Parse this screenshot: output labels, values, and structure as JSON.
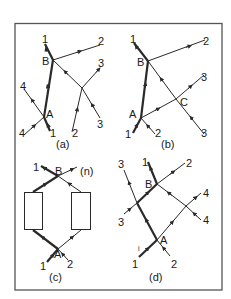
{
  "figure": {
    "frame": {
      "x": 15,
      "y": 23,
      "width": 207,
      "height": 267,
      "stroke": "#555555"
    },
    "colors": {
      "line": "#2a2a2a",
      "background": "#ffffff"
    },
    "panels": [
      {
        "id": "a",
        "caption": "(a)",
        "nodes": [
          {
            "name": "A",
            "label": "A"
          },
          {
            "name": "B",
            "label": "B"
          }
        ],
        "endpoint_labels": [
          "1",
          "2",
          "3",
          "4",
          "4",
          "1",
          "2",
          "3"
        ]
      },
      {
        "id": "b",
        "caption": "(b)",
        "nodes": [
          {
            "name": "A",
            "label": "A"
          },
          {
            "name": "B",
            "label": "B"
          },
          {
            "name": "C",
            "label": "C"
          }
        ],
        "endpoint_labels": [
          "1",
          "2",
          "3",
          "1",
          "2",
          "3"
        ]
      },
      {
        "id": "c",
        "caption": "(c)",
        "nodes": [
          {
            "name": "A",
            "label": "A"
          },
          {
            "name": "B",
            "label": "B"
          }
        ],
        "endpoint_labels": [
          "1",
          "(n)",
          "1",
          "2"
        ],
        "boxes": 2
      },
      {
        "id": "d",
        "caption": "(d)",
        "nodes": [
          {
            "name": "A",
            "label": "A"
          },
          {
            "name": "B",
            "label": "B"
          }
        ],
        "endpoint_labels": [
          "3",
          "1",
          "2",
          "4",
          "3",
          "4",
          "1",
          "2"
        ]
      }
    ]
  },
  "labels": {
    "a": {
      "n1top": "1",
      "n2top": "2",
      "n3top": "3",
      "n4top": "4",
      "B": "B",
      "A": "A",
      "n3bot": "3",
      "n4bot": "4",
      "n1bot": "1",
      "n2bot": "2",
      "cap": "(a)"
    },
    "b": {
      "n1top": "1",
      "n2top": "2",
      "B": "B",
      "n3top": "3",
      "C": "C",
      "A": "A",
      "n1bot": "1",
      "n2bot": "2",
      "n3bot": "3",
      "cap": "(b)"
    },
    "c": {
      "n1": "1",
      "B": "B",
      "nn": "(n)",
      "A": "A",
      "n1bot": "1",
      "n2bot": "2",
      "cap": "(c)"
    },
    "d": {
      "n3top": "3",
      "n1top": "1",
      "n2top": "2",
      "B": "B",
      "n4top": "4",
      "n3bot": "3",
      "n4bot": "4",
      "A": "A",
      "tick": "i",
      "n1bot": "1",
      "n2bot": "2",
      "cap": "(d)"
    }
  }
}
